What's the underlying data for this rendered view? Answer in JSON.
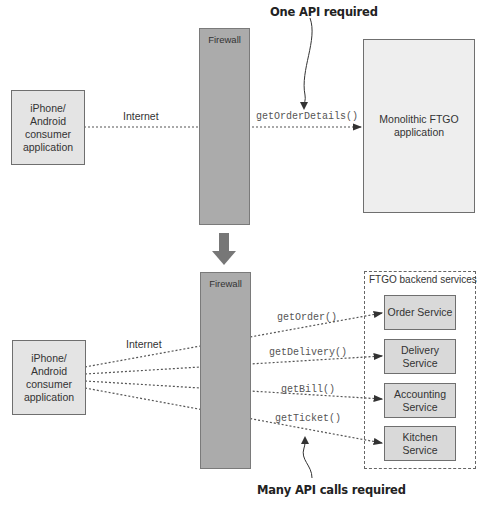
{
  "top": {
    "callout": "One API required",
    "client_label": "iPhone/\nAndroid\nconsumer\napplication",
    "internet_label": "Internet",
    "firewall_label": "Firewall",
    "call_label": "getOrderDetails()",
    "monolith_label": "Monolithic FTGO\napplication"
  },
  "bottom": {
    "callout": "Many API calls required",
    "client_label": "iPhone/\nAndroid\nconsumer\napplication",
    "internet_label": "Internet",
    "firewall_label": "Firewall",
    "group_title": "FTGO backend services",
    "calls": [
      {
        "label": "getOrder()",
        "service": "Order Service"
      },
      {
        "label": "getDelivery()",
        "service": "Delivery\nService"
      },
      {
        "label": "getBill()",
        "service": "Accounting\nService"
      },
      {
        "label": "getTicket()",
        "service": "Kitchen\nService"
      }
    ]
  },
  "colors": {
    "firewall": "#ababab",
    "service_box": "#d9d9d9",
    "client_box": "#e4e4e4",
    "monolith_box": "#eeeeee"
  }
}
